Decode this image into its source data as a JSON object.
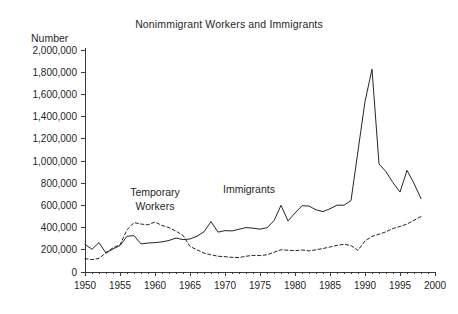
{
  "chart_data": {
    "type": "line",
    "title": "Nonimmigrant Workers and Immigrants",
    "ylabel": "Number",
    "xlabel": "",
    "grid": false,
    "legend_position": "inline-annotations",
    "xlim": [
      1950,
      2000
    ],
    "ylim": [
      0,
      2000000
    ],
    "xticks": [
      1950,
      1955,
      1960,
      1965,
      1970,
      1975,
      1980,
      1985,
      1990,
      1995,
      2000
    ],
    "xtick_labels": [
      "1950",
      "1955",
      "1960",
      "1965",
      "1970",
      "1975",
      "1980",
      "1985",
      "1990",
      "1995",
      "2000"
    ],
    "yticks": [
      0,
      200000,
      400000,
      600000,
      800000,
      1000000,
      1200000,
      1400000,
      1600000,
      1800000,
      2000000
    ],
    "ytick_labels": [
      "0",
      "200,000",
      "400,000",
      "600,000",
      "800,000",
      "1,000,000",
      "1,200,000",
      "1,400,000",
      "1,600,000",
      "1,800,000",
      "2,000,000"
    ],
    "x": [
      1950,
      1951,
      1952,
      1953,
      1954,
      1955,
      1956,
      1957,
      1958,
      1959,
      1960,
      1961,
      1962,
      1963,
      1964,
      1965,
      1966,
      1967,
      1968,
      1969,
      1970,
      1971,
      1972,
      1973,
      1974,
      1975,
      1976,
      1977,
      1978,
      1979,
      1980,
      1981,
      1982,
      1983,
      1984,
      1985,
      1986,
      1987,
      1988,
      1989,
      1990,
      1991,
      1992,
      1993,
      1994,
      1995,
      1996,
      1997,
      1998
    ],
    "series": [
      {
        "name": "Immigrants",
        "style": "solid",
        "color": "#262626",
        "annotation": "Immigrants",
        "values": [
          249000,
          205000,
          265000,
          170000,
          208000,
          238000,
          322000,
          327000,
          253000,
          261000,
          265000,
          271000,
          284000,
          306000,
          292000,
          297000,
          323000,
          362000,
          454000,
          359000,
          373000,
          370000,
          385000,
          400000,
          395000,
          386000,
          399000,
          462000,
          601000,
          460000,
          531000,
          597000,
          594000,
          560000,
          544000,
          570000,
          602000,
          602000,
          643000,
          1091000,
          1536000,
          1827000,
          974000,
          904000,
          804000,
          720000,
          916000,
          798000,
          660000
        ]
      },
      {
        "name": "Temporary Workers",
        "style": "dashed",
        "color": "#262626",
        "annotation_line1": "Temporary",
        "annotation_line2": "Workers",
        "values": [
          120000,
          112000,
          122000,
          175000,
          218000,
          245000,
          380000,
          445000,
          432000,
          425000,
          450000,
          420000,
          400000,
          368000,
          330000,
          230000,
          200000,
          170000,
          155000,
          142000,
          138000,
          132000,
          130000,
          142000,
          150000,
          148000,
          155000,
          178000,
          200000,
          196000,
          192000,
          198000,
          190000,
          200000,
          212000,
          225000,
          240000,
          250000,
          238000,
          195000,
          280000,
          320000,
          340000,
          362000,
          392000,
          410000,
          432000,
          466000,
          500000
        ]
      }
    ]
  }
}
